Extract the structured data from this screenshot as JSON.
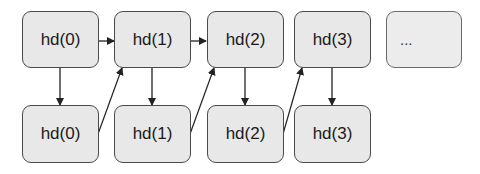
{
  "diagram": {
    "top_row": [
      {
        "label": "hd(0)"
      },
      {
        "label": "hd(1)"
      },
      {
        "label": "hd(2)"
      },
      {
        "label": "hd(3)"
      },
      {
        "label": "..."
      }
    ],
    "bottom_row": [
      {
        "label": "hd(0)"
      },
      {
        "label": "hd(1)"
      },
      {
        "label": "hd(2)"
      },
      {
        "label": "hd(3)"
      }
    ],
    "edges": [
      {
        "from": "top.0",
        "to": "top.1",
        "type": "horizontal"
      },
      {
        "from": "top.1",
        "to": "top.2",
        "type": "horizontal"
      },
      {
        "from": "top.0",
        "to": "bottom.0",
        "type": "vertical"
      },
      {
        "from": "top.1",
        "to": "bottom.1",
        "type": "vertical"
      },
      {
        "from": "top.2",
        "to": "bottom.2",
        "type": "vertical"
      },
      {
        "from": "top.3",
        "to": "bottom.3",
        "type": "vertical"
      },
      {
        "from": "bottom.0",
        "to": "top.1",
        "type": "diagonal"
      },
      {
        "from": "bottom.1",
        "to": "top.2",
        "type": "diagonal"
      },
      {
        "from": "bottom.2",
        "to": "top.3",
        "type": "diagonal"
      }
    ],
    "colors": {
      "box_fill": "#e8e8e8",
      "box_border": "#4a4a4a",
      "arrow": "#222222"
    }
  }
}
